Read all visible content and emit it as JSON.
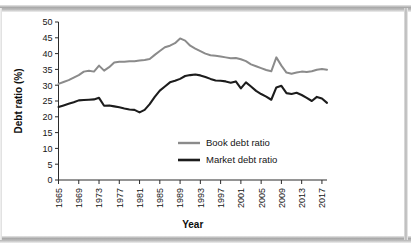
{
  "chart_data": {
    "type": "line",
    "title": "",
    "xlabel": "Year",
    "ylabel": "Debt ratio (%)",
    "xlim": [
      1965,
      2018
    ],
    "ylim": [
      0,
      50
    ],
    "ytick_step": 5,
    "xtick_step": 4,
    "grid": false,
    "legend_position": "center",
    "yticks": [
      0,
      5,
      10,
      15,
      20,
      25,
      30,
      35,
      40,
      45,
      50
    ],
    "ytick_labels": [
      "0",
      "5",
      "10",
      "15",
      "20",
      "25",
      "30",
      "35",
      "40",
      "45",
      "50"
    ],
    "xticks": [
      1965,
      1969,
      1973,
      1977,
      1981,
      1985,
      1989,
      1993,
      1997,
      2001,
      2005,
      2009,
      2013,
      2017
    ],
    "xtick_labels": [
      "1965",
      "1969",
      "1973",
      "1977",
      "1981",
      "1985",
      "1989",
      "1993",
      "1997",
      "2001",
      "2005",
      "2009",
      "2013",
      "2017"
    ],
    "x": [
      1965,
      1966,
      1967,
      1968,
      1969,
      1970,
      1971,
      1972,
      1973,
      1974,
      1975,
      1976,
      1977,
      1978,
      1979,
      1980,
      1981,
      1982,
      1983,
      1984,
      1985,
      1986,
      1987,
      1988,
      1989,
      1990,
      1991,
      1992,
      1993,
      1994,
      1995,
      1996,
      1997,
      1998,
      1999,
      2000,
      2001,
      2002,
      2003,
      2004,
      2005,
      2006,
      2007,
      2008,
      2009,
      2010,
      2011,
      2012,
      2013,
      2014,
      2015,
      2016,
      2017,
      2018
    ],
    "series": [
      {
        "name": "Book debt ratio",
        "color": "#8b8b8b",
        "values": [
          30.4,
          31.0,
          31.6,
          32.4,
          33.2,
          34.3,
          34.6,
          34.3,
          36.2,
          34.6,
          35.7,
          37.2,
          37.4,
          37.4,
          37.6,
          37.6,
          37.8,
          38.0,
          38.3,
          39.6,
          40.8,
          42.0,
          42.5,
          43.3,
          44.8,
          44.1,
          42.5,
          41.6,
          40.8,
          40.0,
          39.5,
          39.3,
          39.1,
          38.8,
          38.5,
          38.6,
          38.2,
          37.6,
          36.6,
          36.0,
          35.4,
          34.8,
          34.4,
          38.8,
          36.2,
          34.0,
          33.6,
          34.0,
          34.3,
          34.2,
          34.4,
          34.9,
          35.1,
          34.9
        ]
      },
      {
        "name": "Market debt ratio",
        "color": "#1c1c1c",
        "values": [
          23.1,
          23.6,
          24.1,
          24.6,
          25.2,
          25.3,
          25.4,
          25.5,
          26.0,
          23.5,
          23.6,
          23.3,
          23.0,
          22.6,
          22.3,
          22.2,
          21.4,
          22.2,
          24.0,
          26.3,
          28.3,
          29.6,
          30.9,
          31.4,
          32.0,
          32.9,
          33.2,
          33.4,
          33.1,
          32.6,
          32.0,
          31.5,
          31.4,
          31.2,
          30.8,
          31.2,
          29.0,
          30.9,
          29.6,
          28.2,
          27.2,
          26.4,
          25.4,
          29.3,
          29.8,
          27.5,
          27.2,
          27.6,
          26.9,
          26.0,
          25.0,
          26.3,
          25.8,
          24.4
        ]
      }
    ]
  },
  "legend": {
    "items": [
      {
        "label": "Book debt ratio"
      },
      {
        "label": "Market debt ratio"
      }
    ]
  }
}
